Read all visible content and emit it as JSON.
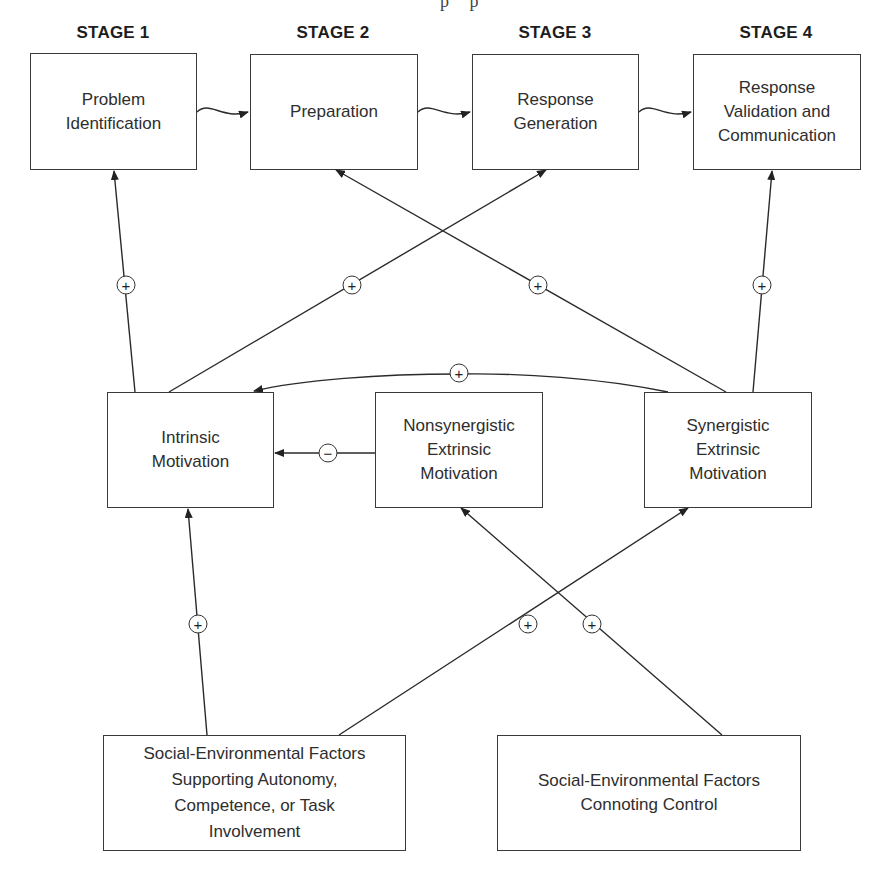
{
  "top_fragment": "p p",
  "stages": [
    {
      "label": "STAGE 1",
      "box": "Problem\nIdentification"
    },
    {
      "label": "STAGE 2",
      "box": "Preparation"
    },
    {
      "label": "STAGE 3",
      "box": "Response\nGeneration"
    },
    {
      "label": "STAGE 4",
      "box": "Response\nValidation and\nCommunication"
    }
  ],
  "motivation": {
    "intrinsic": "Intrinsic\nMotivation",
    "nonsynergistic": "Nonsynergistic\nExtrinsic\nMotivation",
    "synergistic": "Synergistic\nExtrinsic\nMotivation"
  },
  "factors": {
    "supporting": "Social-Environmental Factors\nSupporting Autonomy,\nCompetence, or Task\nInvolvement",
    "controlling": "Social-Environmental Factors\nConnoting Control"
  },
  "signs": {
    "intrinsic_to_stage1": "+",
    "intrinsic_to_stage3": "+",
    "synergistic_to_stage2": "+",
    "synergistic_to_stage4": "+",
    "synergistic_to_intrinsic": "+",
    "nonsynergistic_to_intrinsic": "−",
    "supporting_to_intrinsic": "+",
    "supporting_to_synergistic": "+",
    "controlling_to_nonsynergistic": "+"
  }
}
